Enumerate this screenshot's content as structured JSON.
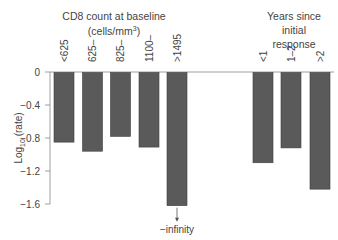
{
  "chart_data": {
    "type": "bar",
    "title": "",
    "xlabel": "",
    "ylabel": "Log10 (rate)",
    "ylim": [
      -1.6,
      0
    ],
    "yticks": [
      0,
      -0.4,
      -0.8,
      -1.2,
      -1.6
    ],
    "ytick_labels": [
      "0",
      "−0.4",
      "−0.8",
      "−1.2",
      "−1.6"
    ],
    "grid": false,
    "legend": null,
    "groups": [
      {
        "name": "CD8 count at baseline (cells/mm³)",
        "title_lines": [
          "CD8 count at baseline",
          "(cells/mm³)"
        ],
        "categories": [
          "<625",
          "625–",
          "825–",
          "1100–",
          ">1495"
        ],
        "values": [
          -0.85,
          -0.96,
          -0.78,
          -0.91,
          -1.62
        ]
      },
      {
        "name": "Years since initial response",
        "title_lines": [
          "Years since",
          "initial",
          "response"
        ],
        "categories": [
          "<1",
          "1–2",
          ">2"
        ],
        "values": [
          -1.1,
          -0.92,
          -1.42
        ]
      }
    ],
    "annotations": [
      {
        "target": ">1495",
        "text": "−infinity",
        "arrow": "down"
      }
    ]
  }
}
